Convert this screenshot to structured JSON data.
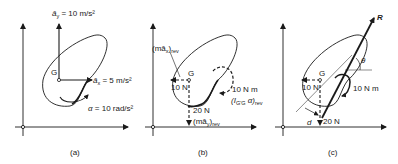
{
  "figure": {
    "panels": [
      {
        "id": "a",
        "caption": "(a)",
        "center_label": "G",
        "ay_label": "ā",
        "ay_sub": "y",
        "ay_value": " = 10 m/s²",
        "ax_label": "ā",
        "ax_sub": "x",
        "ax_value": " = 5 m/s²",
        "alpha_label": "α",
        "alpha_value": " = 10 rad/s²"
      },
      {
        "id": "b",
        "caption": "(b)",
        "center_label": "G",
        "max_label": "(mā",
        "max_sub_x": "x",
        "max_close": ")",
        "max_rev": "rev",
        "force_x": "10 N",
        "force_y": "20 N",
        "may_label": "(mā",
        "may_sub_y": "y",
        "may_close": ")",
        "may_rev": "rev",
        "moment": "10 N m",
        "moment_expr": "(I",
        "moment_sub": "G'G",
        "moment_alpha": " α)",
        "moment_rev": "rev"
      },
      {
        "id": "c",
        "caption": "(c)",
        "center_label": "G",
        "resultant": "R",
        "angle": "θ",
        "force_x": "10 N",
        "force_y": "20 N",
        "moment": "10 N m",
        "distance": "d"
      }
    ]
  }
}
